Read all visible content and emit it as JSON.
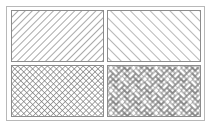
{
  "figure": {
    "title": "",
    "colors": {
      "background": "#ffffff",
      "frame": "#b8b8b8",
      "panel_border": "#8c8c8c",
      "line": "#7a7a7a"
    },
    "panels": [
      {
        "id": "top-left",
        "pattern": "forward-diagonal",
        "label": ""
      },
      {
        "id": "top-right",
        "pattern": "backward-diagonal",
        "label": ""
      },
      {
        "id": "bottom-left",
        "pattern": "diagonal-crosshatch",
        "label": ""
      },
      {
        "id": "bottom-right",
        "pattern": "herringbone",
        "label": ""
      }
    ]
  }
}
